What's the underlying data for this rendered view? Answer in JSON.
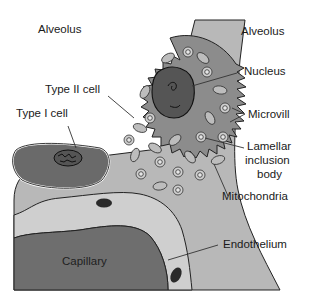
{
  "diagram": {
    "labels": {
      "alveolus_left": "Alveolus",
      "alveolus_right": "Alveolus",
      "type2_cell": "Type II cell",
      "type1_cell": "Type I cell",
      "nucleus": "Nucleus",
      "microvilli": "Microvill",
      "lamellar_line1": "Lamellar",
      "lamellar_line2": "inclusion",
      "lamellar_line3": "body",
      "mitochondria": "Mitochondria",
      "endothelium": "Endothelium",
      "capillary": "Capillary"
    },
    "colors": {
      "background": "#ffffff",
      "interstitium": "#b8b8b8",
      "type1_cytoplasm": "#6a6a6a",
      "type2_cytoplasm": "#8c8c8c",
      "nucleus": "#555555",
      "capillary": "#6e6e6e",
      "endothelium": "#c9c9c9",
      "outline": "#222222"
    }
  }
}
